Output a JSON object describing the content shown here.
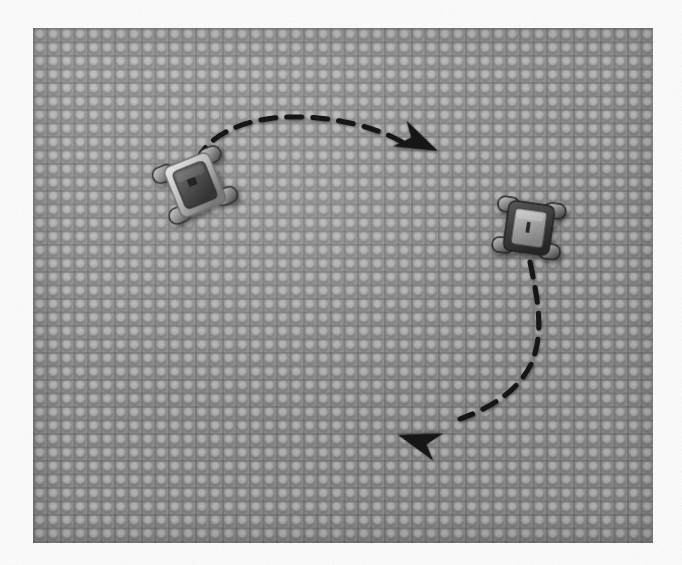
{
  "scene": {
    "title": "Top-down view of two wheeled robots on a pegboard arena",
    "image_width": 682,
    "image_height": 565,
    "background_color": "#fdfdfd"
  },
  "arena": {
    "name": "pegboard-baseplate",
    "x": 33,
    "y": 28,
    "width": 620,
    "height": 515,
    "base_color": "#979797",
    "stud_color": "#b6b6b6",
    "grid_line_color": "#7e7e7e",
    "stud_pitch_px": 13.5,
    "studs_across": 46,
    "studs_down": 38
  },
  "robots": [
    {
      "id": "robot-left",
      "label": "left-robot",
      "center_x": 195,
      "center_y": 185,
      "rotation_deg": -22,
      "body_width": 40,
      "body_height": 46,
      "wheel_count": 4,
      "body_color": "#5b5b5b",
      "chassis_color": "#d5d5d5",
      "wheel_color": "#8e8e8e"
    },
    {
      "id": "robot-right",
      "label": "right-robot",
      "center_x": 529,
      "center_y": 228,
      "rotation_deg": 8,
      "body_width": 38,
      "body_height": 42,
      "wheel_count": 4,
      "body_color": "#9d9d9d",
      "chassis_color": "#4a4a4a",
      "wheel_color": "#6f6f6f"
    }
  ],
  "trajectories": [
    {
      "id": "trajectory-upper",
      "label": "upper-dashed-arc",
      "from_robot": "robot-left",
      "direction": "left-to-right",
      "style": "dashed",
      "color": "#121212",
      "stroke_width": 5,
      "dash_pattern": "15 11",
      "path": "M 197,160 C 210,134 245,118 290,117 C 336,116 378,128 404,143",
      "arrowhead": {
        "tip_x": 438,
        "tip_y": 151,
        "rotation_deg": 24,
        "size": 42,
        "color": "#121212"
      }
    },
    {
      "id": "trajectory-lower",
      "label": "lower-dashed-arc",
      "from_robot": "robot-right",
      "direction": "down-and-left",
      "style": "dashed",
      "color": "#121212",
      "stroke_width": 5,
      "dash_pattern": "15 11",
      "path": "M 530,262 C 538,300 544,332 532,362 C 518,393 487,409 460,419",
      "arrowhead": {
        "tip_x": 398,
        "tip_y": 435,
        "rotation_deg": 196,
        "size": 42,
        "color": "#121212"
      }
    }
  ]
}
